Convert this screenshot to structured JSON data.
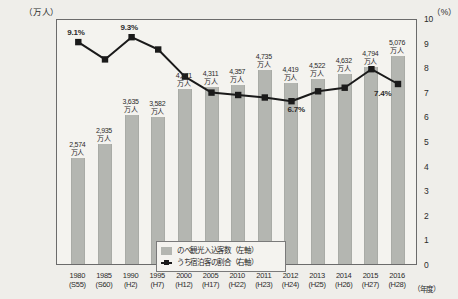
{
  "axes": {
    "left_unit": "（万人）",
    "right_unit": "（%）",
    "x_unit": "（年度）",
    "left_ticks": [
      "6,000",
      "5,000",
      "4,000",
      "3,000",
      "2,000",
      "1,000",
      "0"
    ],
    "right_ticks": [
      "10",
      "9",
      "8",
      "7",
      "6",
      "5",
      "4",
      "3",
      "2",
      "1",
      "0"
    ]
  },
  "legend": {
    "bar_label": "のべ観光入込客数（左軸）",
    "line_label": "うち宿泊客の割合（右軸）"
  },
  "colors": {
    "bar_fill": "#b4b6b1",
    "line_stroke": "#1a1a1a",
    "frame": "#6b6b6b",
    "background": "#efeeea",
    "plot_background": "#f4f3ef"
  },
  "chart_data": {
    "type": "bar",
    "title": "",
    "subtitle": "",
    "xlabel": "（年度）",
    "ylabel": "（万人）",
    "y2label": "（%）",
    "ylim": [
      0,
      6000
    ],
    "y2lim": [
      0,
      10
    ],
    "grid": false,
    "legend_position": "inside-bottom-left",
    "categories": [
      "1980",
      "1985",
      "1990",
      "1995",
      "2000",
      "2005",
      "2010",
      "2011",
      "2012",
      "2013",
      "2014",
      "2015",
      "2016"
    ],
    "category_sublabels": [
      "(S55)",
      "(S60)",
      "(H2)",
      "(H7)",
      "(H12)",
      "(H17)",
      "(H22)",
      "(H23)",
      "(H24)",
      "(H25)",
      "(H26)",
      "(H27)",
      "(H28)"
    ],
    "series": [
      {
        "name": "のべ観光入込客数（左軸）",
        "type": "bar",
        "axis": "left",
        "unit": "万人",
        "values": [
          2574,
          2935,
          3635,
          3582,
          4271,
          4311,
          4357,
          4735,
          4419,
          4522,
          4632,
          4794,
          5076
        ],
        "data_labels": [
          "2,574\n万人",
          "2,935\n万人",
          "3,635\n万人",
          "3,582\n万人",
          "4,271\n万人",
          "4,311\n万人",
          "4,357\n万人",
          "4,735\n万人",
          "4,419\n万人",
          "4,522\n万人",
          "4,632\n万人",
          "4,794\n万人",
          "5,076\n万人"
        ]
      },
      {
        "name": "うち宿泊客の割合（右軸）",
        "type": "line",
        "axis": "right",
        "unit": "%",
        "values": [
          9.1,
          8.4,
          9.3,
          8.8,
          7.7,
          7.05,
          6.95,
          6.85,
          6.7,
          7.1,
          7.25,
          8.0,
          7.4
        ],
        "annotations": [
          {
            "index": 0,
            "text": "9.1%"
          },
          {
            "index": 2,
            "text": "9.3%"
          },
          {
            "index": 8,
            "text": "6.7%"
          },
          {
            "index": 12,
            "text": "7.4%"
          }
        ]
      }
    ]
  }
}
